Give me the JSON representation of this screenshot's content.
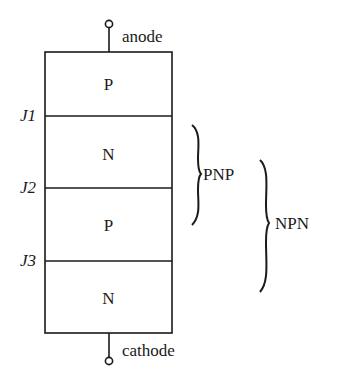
{
  "diagram": {
    "title": "",
    "terminals": {
      "top": "anode",
      "bottom": "cathode"
    },
    "layers": [
      {
        "label": "P"
      },
      {
        "label": "N"
      },
      {
        "label": "P"
      },
      {
        "label": "N"
      }
    ],
    "junctions": [
      {
        "label": "J1"
      },
      {
        "label": "J2"
      },
      {
        "label": "J3"
      }
    ],
    "groups": [
      {
        "label": "PNP",
        "spans": "layers 1-3"
      },
      {
        "label": "NPN",
        "spans": "layers 2-4"
      }
    ]
  }
}
